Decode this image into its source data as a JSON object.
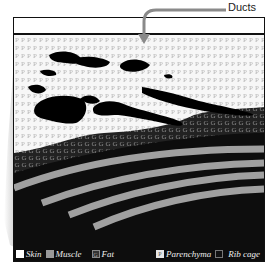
{
  "figure": {
    "annotation": {
      "label": "Ducts",
      "arrow_color": "#8a8a8a"
    },
    "tissue_layers": [
      "Parenchyma",
      "Fat",
      "Muscle",
      "Rib cage"
    ],
    "pattern_letters": {
      "parenchyma": "P",
      "fat": "G"
    }
  },
  "legend": {
    "items": [
      {
        "label": "Skin",
        "swatch": "#ffffff",
        "glyph": ""
      },
      {
        "label": "Muscle",
        "swatch": "#9a9a9a",
        "glyph": ""
      },
      {
        "label": "Fat",
        "swatch": "#333333",
        "glyph": "G"
      },
      {
        "label": "Parenchyma",
        "swatch": "#e6e6e6",
        "glyph": "P"
      },
      {
        "label": "Rib cage",
        "swatch": "#111111",
        "glyph": ""
      }
    ]
  },
  "colors": {
    "frame": "#111111",
    "parenchyma_bg": "#f4f4f4",
    "fat_bg": "#2a2a2a",
    "muscle": "#a0a0a0",
    "ducts": "#000000",
    "ribcage": "#0d0d0d"
  }
}
